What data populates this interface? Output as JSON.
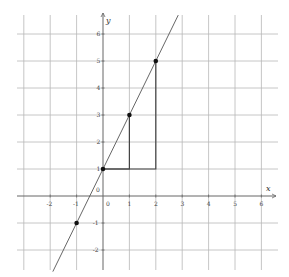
{
  "diagram": {
    "type": "coordinate-plane",
    "axes": {
      "x_label": "x",
      "y_label": "y",
      "origin_label": "0",
      "x_range": [
        -3,
        6
      ],
      "y_range": [
        -2,
        6
      ]
    },
    "x_tick_labels": [
      {
        "value": -2,
        "text": "-2"
      },
      {
        "value": -1,
        "text": "-1"
      },
      {
        "value": 0,
        "text": "0"
      },
      {
        "value": 1,
        "text": "1"
      },
      {
        "value": 2,
        "text": "2"
      },
      {
        "value": 3,
        "text": "3"
      },
      {
        "value": 4,
        "text": "4"
      },
      {
        "value": 5,
        "text": "5"
      },
      {
        "value": 6,
        "text": "6"
      }
    ],
    "y_tick_labels": [
      {
        "value": 6,
        "text": "6"
      },
      {
        "value": 5,
        "text": "5"
      },
      {
        "value": 4,
        "text": "4"
      },
      {
        "value": 3,
        "text": "3"
      },
      {
        "value": 2,
        "text": "2"
      },
      {
        "value": 1,
        "text": "1"
      },
      {
        "value": -1,
        "text": "-1"
      },
      {
        "value": -2,
        "text": "-2"
      }
    ],
    "line": {
      "equation": "y = 2x + 1",
      "slope": 2,
      "intercept": 1,
      "x_from": -1.9,
      "x_to": 2.85
    },
    "points": [
      {
        "x": -1,
        "y": -1
      },
      {
        "x": 0,
        "y": 1
      },
      {
        "x": 1,
        "y": 3
      },
      {
        "x": 2,
        "y": 5
      }
    ],
    "slope_triangles": [
      {
        "from": [
          0,
          1
        ],
        "to": [
          1,
          3
        ]
      },
      {
        "from": [
          0,
          1
        ],
        "to": [
          2,
          5
        ]
      }
    ],
    "colors": {
      "grid": "#b8b8b8",
      "axis": "#666666",
      "line": "#555555",
      "point": "#111111",
      "triangle": "#444444"
    }
  }
}
